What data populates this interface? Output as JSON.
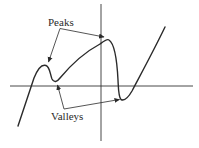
{
  "diagram": {
    "type": "function-graph",
    "labels": {
      "peaks": "Peaks",
      "valleys": "Valleys"
    },
    "colors": {
      "stroke": "#2a2a2a",
      "axis": "#333333",
      "background": "#ffffff"
    },
    "features": {
      "peaks": [
        {
          "name": "local-peak-left",
          "x": 45,
          "y": 66
        },
        {
          "name": "local-peak-right",
          "x": 105,
          "y": 38
        }
      ],
      "valleys": [
        {
          "name": "local-valley-left",
          "x": 55,
          "y": 82
        },
        {
          "name": "local-valley-right",
          "x": 122,
          "y": 100
        }
      ]
    }
  }
}
